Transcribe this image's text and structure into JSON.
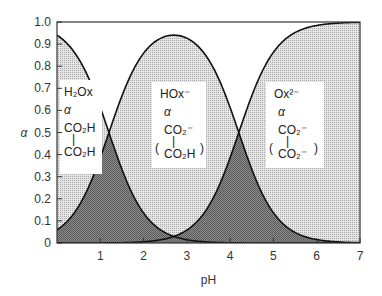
{
  "chart_data": {
    "type": "area",
    "title": "",
    "xlabel": "pH",
    "ylabel": "α",
    "xlim": [
      0,
      7
    ],
    "ylim": [
      0,
      1.0
    ],
    "x_ticks": [
      "1",
      "2",
      "3",
      "4",
      "5",
      "6",
      "7"
    ],
    "y_ticks": [
      "0",
      "0.1",
      "0.2",
      "0.3",
      "0.4",
      "0.5",
      "0.6",
      "0.7",
      "0.8",
      "0.9",
      "1.0"
    ],
    "pKa1": 1.2,
    "pKa2": 4.2,
    "series": [
      {
        "name": "H2Ox",
        "label_lines": [
          "H₂Ox",
          "α",
          "CO₂H",
          "|",
          "CO₂H"
        ],
        "x": [
          0,
          0.5,
          1,
          1.2,
          1.5,
          2,
          2.5,
          3,
          3.5
        ],
        "values": [
          0.94,
          0.83,
          0.61,
          0.5,
          0.33,
          0.14,
          0.05,
          0.015,
          0.0
        ]
      },
      {
        "name": "HOx-",
        "label_lines": [
          "HOx⁻",
          "α",
          "CO₂⁻",
          "|",
          "CO₂H"
        ],
        "x": [
          0,
          0.5,
          1,
          1.2,
          1.5,
          2,
          2.5,
          2.7,
          3,
          3.5,
          4,
          4.2,
          4.5,
          5,
          5.5,
          6,
          6.5,
          7
        ],
        "values": [
          0.06,
          0.17,
          0.39,
          0.5,
          0.66,
          0.85,
          0.92,
          0.93,
          0.92,
          0.83,
          0.61,
          0.5,
          0.33,
          0.14,
          0.05,
          0.016,
          0.005,
          0.0
        ]
      },
      {
        "name": "Ox2-",
        "label_lines": [
          "Ox²⁻",
          "α",
          "CO₂⁻",
          "|",
          "CO₂⁻"
        ],
        "x": [
          2.5,
          3,
          3.5,
          4,
          4.2,
          4.5,
          5,
          5.5,
          6,
          6.5,
          7
        ],
        "values": [
          0.0,
          0.06,
          0.17,
          0.39,
          0.5,
          0.67,
          0.86,
          0.95,
          0.98,
          0.995,
          1.0
        ]
      }
    ],
    "grid": false,
    "legend": "inline labels"
  }
}
